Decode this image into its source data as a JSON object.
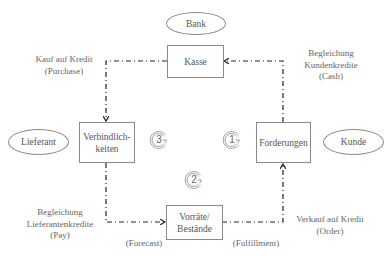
{
  "diagram": {
    "entities": {
      "bank": "Bank",
      "lieferant": "Lieferant",
      "kunde": "Kunde"
    },
    "nodes": {
      "kasse": "Kasse",
      "verbindlichkeiten_line1": "Verbindlich-",
      "verbindlichkeiten_line2": "keiten",
      "forderungen": "Forderungen",
      "vorraete_line1": "Vorräte/",
      "vorraete_line2": "Bestände"
    },
    "edges": {
      "purchase_line1": "Kauf auf Kredit",
      "purchase_line2": "(Purchase)",
      "cash_line1": "Begleichung",
      "cash_line2": "Kundenkredite",
      "cash_line3": "(Cash)",
      "pay_line1": "Begleichung",
      "pay_line2": "Lieferantenkredite",
      "pay_line3": "(Pay)",
      "order_line1": "Verkauf auf Kredit",
      "order_line2": "(Order)",
      "forecast": "(Forecast)",
      "fulfillment": "(Fulfillment)"
    },
    "cycles": [
      {
        "number": "1"
      },
      {
        "number": "2"
      },
      {
        "number": "3"
      }
    ],
    "colors": {
      "line": "#222222",
      "box_border": "#8a8a8a",
      "text": "#555555"
    }
  }
}
